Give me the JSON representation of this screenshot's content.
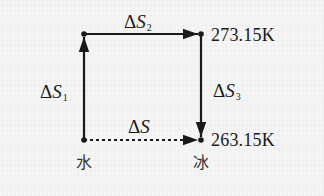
{
  "diagram": {
    "type": "thermodynamic-cycle",
    "background_color": "#f3f3f3",
    "line_color": "#1a1a1a",
    "nodes": [
      {
        "id": "bottom-left",
        "x": 84,
        "y": 140
      },
      {
        "id": "top-left",
        "x": 84,
        "y": 34
      },
      {
        "id": "top-right",
        "x": 201,
        "y": 34
      },
      {
        "id": "bottom-right",
        "x": 201,
        "y": 140
      }
    ],
    "edges": [
      {
        "from": "bottom-left",
        "to": "top-left",
        "style": "solid",
        "label": {
          "delta": "Δ",
          "symbol": "S",
          "subscript": "1"
        }
      },
      {
        "from": "top-left",
        "to": "top-right",
        "style": "solid",
        "label": {
          "delta": "Δ",
          "symbol": "S",
          "subscript": "2"
        }
      },
      {
        "from": "top-right",
        "to": "bottom-right",
        "style": "solid",
        "label": {
          "delta": "Δ",
          "symbol": "S",
          "subscript": "3"
        }
      },
      {
        "from": "bottom-left",
        "to": "bottom-right",
        "style": "dashed",
        "label": {
          "delta": "Δ",
          "symbol": "S",
          "subscript": ""
        }
      }
    ],
    "temperatures": {
      "top": "273.15K",
      "bottom": "263.15K"
    },
    "phases": {
      "left": "水",
      "right": "冰"
    }
  }
}
